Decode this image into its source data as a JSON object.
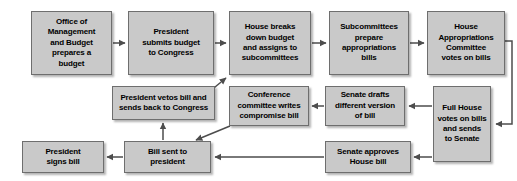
{
  "diagram": {
    "type": "flowchart",
    "palette": {
      "node_fill": "#c9c9c9",
      "node_border": "#6e6e6e",
      "text": "#000000",
      "connector": "#4d4d4d",
      "background": "#ffffff"
    },
    "nodes": [
      {
        "id": "omb",
        "label": "Office of\nManagement\nand Budget\nprepares a\nbudget",
        "x": 31,
        "y": 11,
        "w": 81,
        "h": 64
      },
      {
        "id": "president-submits",
        "label": "President\nsubmits budget\nto Congress",
        "x": 128,
        "y": 11,
        "w": 86,
        "h": 64
      },
      {
        "id": "house-breaks-down",
        "label": "House breaks\ndown budget\nand assigns to\nsubcommittees",
        "x": 229,
        "y": 11,
        "w": 82,
        "h": 64
      },
      {
        "id": "subcommittees-prepare",
        "label": "Subcommittees\nprepare\nappropriations\nbills",
        "x": 329,
        "y": 11,
        "w": 80,
        "h": 64
      },
      {
        "id": "house-appropriations",
        "label": "House\nAppropriations\nCommittee\nvotes on bills",
        "x": 427,
        "y": 11,
        "w": 78,
        "h": 64
      },
      {
        "id": "full-house-votes",
        "label": "Full House\nvotes on bills\nand sends\nto Senate",
        "x": 433,
        "y": 86,
        "w": 58,
        "h": 76
      },
      {
        "id": "senate-drafts",
        "label": "Senate drafts\ndifferent version\nof bill",
        "x": 325,
        "y": 86,
        "w": 80,
        "h": 40
      },
      {
        "id": "conference-committee",
        "label": "Conference\ncommittee writes\ncompromise bill",
        "x": 229,
        "y": 86,
        "w": 80,
        "h": 40
      },
      {
        "id": "president-vetos",
        "label": "President vetos bill and\nsends back to Congress",
        "x": 112,
        "y": 86,
        "w": 103,
        "h": 34
      },
      {
        "id": "senate-approves",
        "label": "Senate approves\nHouse bill",
        "x": 325,
        "y": 141,
        "w": 86,
        "h": 32
      },
      {
        "id": "bill-sent",
        "label": "Bill sent to\npresident",
        "x": 124,
        "y": 141,
        "w": 87,
        "h": 32
      },
      {
        "id": "president-signs",
        "label": "President\nsigns bill",
        "x": 22,
        "y": 141,
        "w": 82,
        "h": 32
      }
    ],
    "connectors": [
      {
        "id": "omb-to-president-submits",
        "from": "omb",
        "to": "president-submits",
        "style": "straight-right"
      },
      {
        "id": "president-submits-to-house-breaks-down",
        "from": "president-submits",
        "to": "house-breaks-down",
        "style": "straight-right"
      },
      {
        "id": "house-breaks-down-to-subcommittees",
        "from": "house-breaks-down",
        "to": "subcommittees-prepare",
        "style": "straight-right"
      },
      {
        "id": "subcommittees-to-house-appropriations",
        "from": "subcommittees-prepare",
        "to": "house-appropriations",
        "style": "straight-right"
      },
      {
        "id": "house-appropriations-to-full-house",
        "from": "house-appropriations",
        "to": "full-house-votes",
        "style": "wrap-around-right"
      },
      {
        "id": "full-house-to-senate-drafts",
        "from": "full-house-votes",
        "to": "senate-drafts",
        "style": "straight-left"
      },
      {
        "id": "senate-drafts-to-conference",
        "from": "senate-drafts",
        "to": "conference-committee",
        "style": "straight-left"
      },
      {
        "id": "conference-to-bill-sent",
        "from": "conference-committee",
        "to": "bill-sent",
        "style": "diagonal-down-left"
      },
      {
        "id": "bill-sent-to-house-breaks-down",
        "from": "bill-sent",
        "to": "house-breaks-down",
        "style": "diagonal-up-right"
      },
      {
        "id": "full-house-to-senate-approves",
        "from": "full-house-votes",
        "to": "senate-approves",
        "style": "straight-left"
      },
      {
        "id": "senate-approves-to-bill-sent",
        "from": "senate-approves",
        "to": "bill-sent",
        "style": "straight-left"
      },
      {
        "id": "bill-sent-to-president-vetos",
        "from": "bill-sent",
        "to": "president-vetos",
        "style": "straight-up"
      },
      {
        "id": "bill-sent-to-president-signs",
        "from": "bill-sent",
        "to": "president-signs",
        "style": "straight-left"
      }
    ]
  }
}
